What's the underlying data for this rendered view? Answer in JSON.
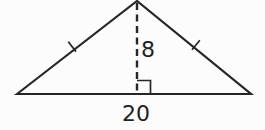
{
  "figure": {
    "type": "isosceles-triangle-with-altitude",
    "altitude": {
      "label": "8",
      "style": "dashed-vertical-line"
    },
    "base": {
      "label": "20"
    },
    "markers": {
      "right_angle_marker": "small square at foot of altitude",
      "left_side_tick": "single tick mark (equal side)",
      "right_side_tick": "single tick mark (equal side)"
    },
    "colors": {
      "line": "#262626",
      "text": "#1f1f1f",
      "background": "#fcfcfc"
    }
  }
}
